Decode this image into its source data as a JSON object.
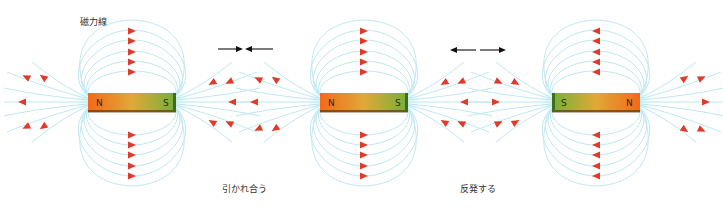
{
  "labels": {
    "field_lines": "磁力線",
    "attract": "引かれ合う",
    "repel": "反発する"
  },
  "colors": {
    "field_line": "#bfe8f0",
    "arrow": "#e03a2a",
    "magnet_north": "#f07a20",
    "magnet_south": "#6aa630",
    "force_arrow": "#111111"
  },
  "magnets": [
    {
      "id": "magnet-1",
      "left_pole": "N",
      "right_pole": "S",
      "cx": 132,
      "cy": 102,
      "field_direction": "N-to-S (arrows point right over/under, outward at N, inward at S)"
    },
    {
      "id": "magnet-2",
      "left_pole": "N",
      "right_pole": "S",
      "cx": 364,
      "cy": 102,
      "field_direction": "N-to-S"
    },
    {
      "id": "magnet-3",
      "left_pole": "S",
      "right_pole": "N",
      "cx": 596,
      "cy": 102,
      "field_direction": "N-to-S (arrows point left)"
    }
  ],
  "force_indicators": [
    {
      "id": "attract",
      "type": "converging",
      "description": "→ ←"
    },
    {
      "id": "repel",
      "type": "diverging",
      "description": "← →"
    }
  ]
}
